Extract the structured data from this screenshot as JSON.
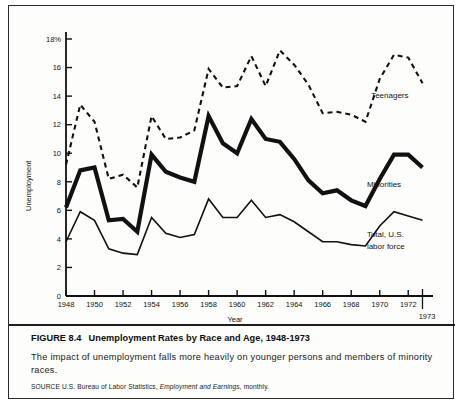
{
  "figure": {
    "number": "FIGURE 8.4",
    "title": "Unemployment Rates by Race and Age, 1948-1973",
    "caption": "The impact of unemployment falls more heavily on younger persons and members of minority races.",
    "source_prefix": "SOURCE U.S. Bureau of Labor Statistics,",
    "source_italic": "Employment and Earnings,",
    "source_suffix": "monthly."
  },
  "chart_data": {
    "type": "line",
    "title": "Unemployment Rates by Race and Age, 1948-1973",
    "xlabel": "Year",
    "ylabel": "Unemployment",
    "xlim": [
      1948,
      1973
    ],
    "ylim": [
      0,
      18
    ],
    "grid": false,
    "legend_position": "inline-right-annotations",
    "y_ticks": [
      0,
      2,
      4,
      6,
      8,
      10,
      12,
      14,
      16,
      18
    ],
    "y_tick_labels": [
      "0",
      "2",
      "4",
      "6",
      "8",
      "10",
      "12",
      "14",
      "16",
      "18%"
    ],
    "x_ticks": [
      1948,
      1950,
      1952,
      1954,
      1956,
      1958,
      1960,
      1962,
      1964,
      1966,
      1968,
      1970,
      1972
    ],
    "x_tick_labels": [
      "1948",
      "1950",
      "1952",
      "1954",
      "1956",
      "1958",
      "1960",
      "1962",
      "1964",
      "1966",
      "1968",
      "1970",
      "1972"
    ],
    "x_end_label": "1973",
    "x": [
      1948,
      1949,
      1950,
      1951,
      1952,
      1953,
      1954,
      1955,
      1956,
      1957,
      1958,
      1959,
      1960,
      1961,
      1962,
      1963,
      1964,
      1965,
      1966,
      1967,
      1968,
      1969,
      1970,
      1971,
      1972,
      1973
    ],
    "series": [
      {
        "name": "Teenagers",
        "style": "dashed",
        "width": 2.1,
        "color": "#111111",
        "label_x": 1969.4,
        "label_y": 13.9,
        "values": [
          9.2,
          13.4,
          12.2,
          8.2,
          8.5,
          7.6,
          12.6,
          11.0,
          11.1,
          11.6,
          15.9,
          14.6,
          14.7,
          16.8,
          14.7,
          17.2,
          16.2,
          14.8,
          12.8,
          12.9,
          12.7,
          12.2,
          15.2,
          16.9,
          16.7,
          14.9
        ]
      },
      {
        "name": "Minorities",
        "style": "solid",
        "width": 4.2,
        "color": "#111111",
        "label_x": 1969.1,
        "label_y": 7.6,
        "values": [
          6.2,
          8.8,
          9.0,
          5.3,
          5.4,
          4.5,
          9.9,
          8.7,
          8.3,
          8.0,
          12.6,
          10.7,
          10.0,
          12.4,
          11.0,
          10.8,
          9.6,
          8.1,
          7.2,
          7.4,
          6.7,
          6.3,
          8.2,
          9.9,
          9.9,
          9.0
        ]
      },
      {
        "name": "Total, U.S. labor force",
        "label_line1": "Total, U.S.",
        "label_line2": "labor force",
        "style": "solid",
        "width": 1.6,
        "color": "#111111",
        "label_x": 1969.1,
        "label_y": 4.1,
        "values": [
          3.8,
          5.9,
          5.3,
          3.3,
          3.0,
          2.9,
          5.5,
          4.4,
          4.1,
          4.3,
          6.8,
          5.5,
          5.5,
          6.7,
          5.5,
          5.7,
          5.2,
          4.5,
          3.8,
          3.8,
          3.6,
          3.5,
          4.9,
          5.9,
          5.6,
          5.3
        ]
      }
    ]
  }
}
